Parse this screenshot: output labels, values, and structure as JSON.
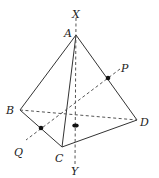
{
  "diagram": {
    "type": "tetrahedron",
    "colors": {
      "stroke": "#333333",
      "background": "#ffffff"
    },
    "vertices": {
      "A": {
        "label": "A",
        "x": 76,
        "y": 35
      },
      "B": {
        "label": "B",
        "x": 20,
        "y": 110
      },
      "C": {
        "label": "C",
        "x": 62,
        "y": 147
      },
      "D": {
        "label": "D",
        "x": 137,
        "y": 120
      }
    },
    "axis_points": {
      "X": {
        "label": "X"
      },
      "Y": {
        "label": "Y"
      },
      "P": {
        "label": "P"
      },
      "Q": {
        "label": "Q"
      }
    },
    "solid_edges": [
      "AB",
      "AC",
      "AD",
      "BC",
      "CD"
    ],
    "hidden_edges": [
      "BD"
    ],
    "axes": [
      "XY",
      "PQ"
    ]
  }
}
